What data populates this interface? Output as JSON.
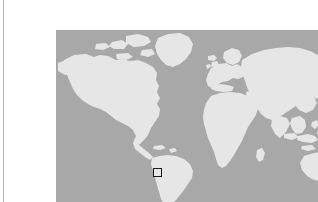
{
  "figure": {
    "type": "world-map",
    "projection": "equirectangular",
    "title": "",
    "caption": "",
    "colors": {
      "ocean": "#a8a8a8",
      "land": "#e6e6e6",
      "marker_border": "#1a1a1a",
      "marker_fill": "#e8e8e8",
      "page_background": "#ffffff",
      "rule": "#b9b9b9"
    },
    "bounds": {
      "left_px": 16,
      "top_px": 14,
      "width_px": 285,
      "height_px": 177
    }
  },
  "marker": {
    "label": "",
    "shape": "square",
    "size_px": 9,
    "center_x_px": 117,
    "center_y_px": 156,
    "region": "southern South America"
  },
  "landmasses": [
    {
      "name": "north-america"
    },
    {
      "name": "greenland"
    },
    {
      "name": "south-america"
    },
    {
      "name": "europe"
    },
    {
      "name": "africa"
    },
    {
      "name": "asia"
    },
    {
      "name": "australia"
    },
    {
      "name": "indonesia"
    },
    {
      "name": "japan"
    },
    {
      "name": "new-zealand"
    },
    {
      "name": "madagascar"
    },
    {
      "name": "british-isles"
    },
    {
      "name": "iceland"
    }
  ],
  "rule": {
    "orientation": "vertical",
    "x_px": 3
  }
}
